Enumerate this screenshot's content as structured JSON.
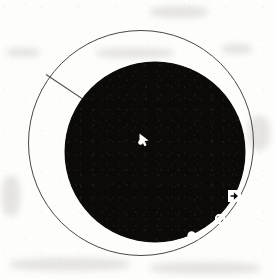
{
  "figure": {
    "background_color": "#fdfdfc",
    "ink_color": "#4a4845",
    "fill_color": "#0b0a09",
    "marker_color": "#ffffff"
  },
  "shapes": {
    "outline_circle": {
      "name": "outline-circle",
      "label": "Thin outline circle",
      "center_x": 140,
      "center_y": 142,
      "radius": 112,
      "stroke_width": 1,
      "stroke_color": "#4a4845"
    },
    "filled_disc": {
      "name": "filled-disc",
      "label": "Solid black disc",
      "center_x": 155,
      "center_y": 152,
      "radius": 90,
      "fill_color": "#0b0a09"
    },
    "sector_line": {
      "name": "sector-line",
      "label": "Radial sector line",
      "start_x": 46,
      "start_y": 74,
      "end_x": 100,
      "end_y": 110,
      "stroke_color": "#4a4845"
    }
  },
  "markers": [
    {
      "id": "cursor",
      "icon": "cursor-arrow-icon",
      "label": "Cursor arrow marker",
      "x": 138,
      "y": 133,
      "color": "#ffffff"
    },
    {
      "id": "box-arrow",
      "icon": "square-right-arrow-icon",
      "label": "Boxed right arrow marker",
      "x": 228,
      "y": 190,
      "color": "#ffffff"
    },
    {
      "id": "ring",
      "icon": "small-ring-icon",
      "label": "Small ring marker",
      "x": 215,
      "y": 214,
      "color": "#ffffff"
    },
    {
      "id": "blob",
      "icon": "filled-dot-icon",
      "label": "Filled dot marker",
      "x": 187,
      "y": 231,
      "color": "#ffffff"
    }
  ]
}
